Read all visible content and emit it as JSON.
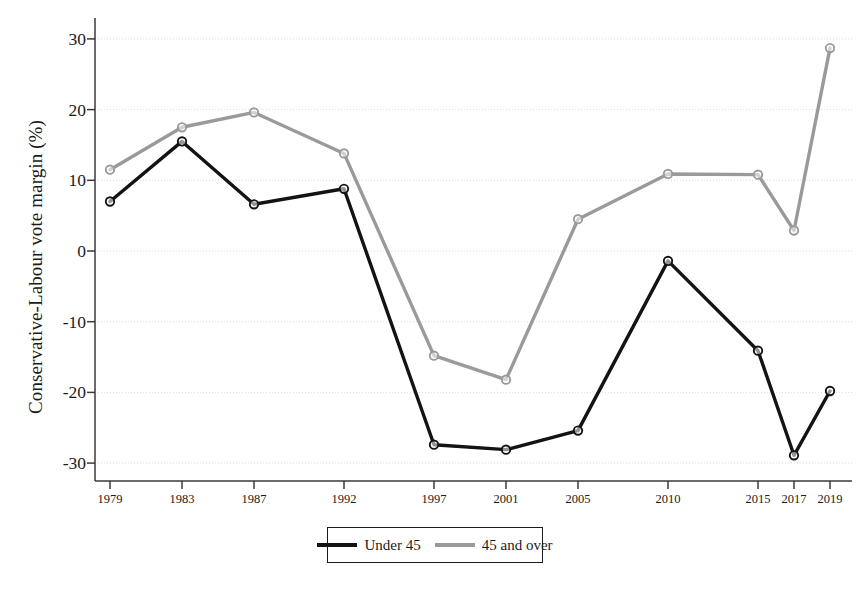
{
  "chart_data": {
    "type": "line",
    "title": "",
    "xlabel": "",
    "ylabel": "Conservative-Labour vote margin (%)",
    "x": [
      1979,
      1983,
      1987,
      1992,
      1997,
      2001,
      2005,
      2010,
      2015,
      2017,
      2019
    ],
    "xticklabels": [
      "1979",
      "1983",
      "1987",
      "1992",
      "1997",
      "2001",
      "2005",
      "2010",
      "2015",
      "2017",
      "2019"
    ],
    "yticklabels": [
      "30",
      "20",
      "10",
      "0",
      "-10",
      "-20",
      "-30"
    ],
    "yticks": [
      30,
      20,
      10,
      0,
      -10,
      -20,
      -30
    ],
    "ylim": [
      -33,
      32
    ],
    "xlim": [
      1977,
      2021
    ],
    "grid": "horizontal",
    "legend_position": "bottom-center",
    "series": [
      {
        "name": "Under 45",
        "color": "#131313",
        "linewidth": 3.4,
        "marker": "circle",
        "values": [
          7.0,
          15.5,
          6.6,
          8.8,
          -27.4,
          -28.1,
          -25.4,
          -1.4,
          -14.1,
          -28.9,
          -19.8
        ]
      },
      {
        "name": "45 and over",
        "color": "#9a9a9a",
        "linewidth": 3.4,
        "marker": "circle",
        "values": [
          11.5,
          17.5,
          19.6,
          13.8,
          -14.8,
          -18.2,
          4.5,
          10.9,
          10.8,
          2.9,
          28.7
        ]
      }
    ]
  },
  "legend": {
    "items": [
      {
        "label": "Under 45",
        "color": "#131313"
      },
      {
        "label": "45 and over",
        "color": "#9a9a9a"
      }
    ]
  }
}
